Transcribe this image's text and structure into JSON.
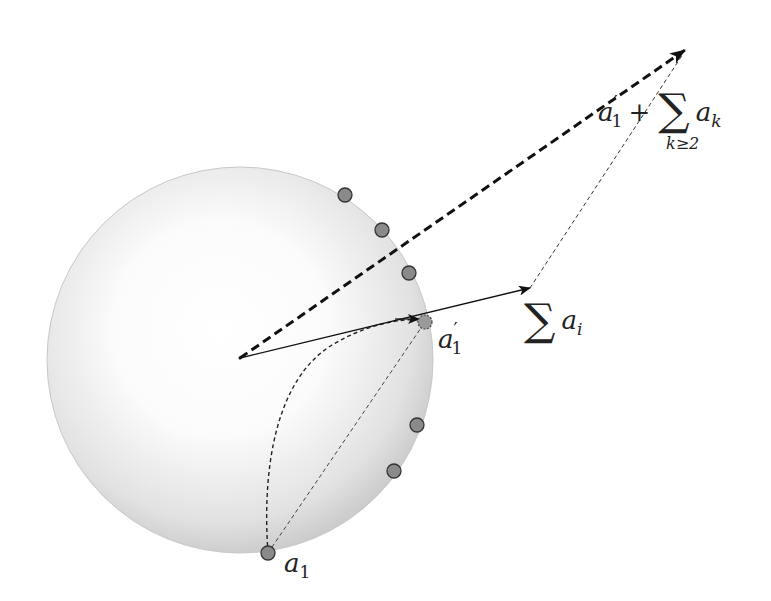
{
  "figure": {
    "width": 771,
    "height": 601,
    "background": "#ffffff"
  },
  "sphere": {
    "cx": 240,
    "cy": 360,
    "r": 193,
    "highlight_color": "#ffffff",
    "edge_color": "#b8b8b8"
  },
  "origin": {
    "x": 240,
    "y": 358
  },
  "vectors": {
    "sum_ai": {
      "x2": 530,
      "y2": 288,
      "style": "solid"
    },
    "a1_prime_plus_sum": {
      "x2": 685,
      "y2": 50,
      "style": "bold-dashed"
    },
    "connector": {
      "x1": 530,
      "y1": 288,
      "x2": 685,
      "y2": 50,
      "style": "thin-dotted"
    }
  },
  "points": {
    "a1": {
      "x": 268,
      "y": 553
    },
    "a1_prime": {
      "x": 425,
      "y": 322
    },
    "others": [
      {
        "x": 345,
        "y": 195
      },
      {
        "x": 382,
        "y": 230
      },
      {
        "x": 409,
        "y": 273
      },
      {
        "x": 417,
        "y": 425
      },
      {
        "x": 394,
        "y": 471
      }
    ],
    "fill": "#8a8a8a",
    "stroke": "#333333"
  },
  "labels": {
    "a1": {
      "base": "a",
      "sub": "1"
    },
    "a1_prime": {
      "base": "a",
      "prime": "′",
      "sub": "1"
    },
    "sum_ai": {
      "sigma": "∑",
      "term": "a",
      "sub": "i"
    },
    "top_sum": {
      "base": "a",
      "prime": "′",
      "sub": "1",
      "plus": "+",
      "sigma": "∑",
      "term": "a",
      "term_sub": "k",
      "limit": "k≥2"
    }
  }
}
